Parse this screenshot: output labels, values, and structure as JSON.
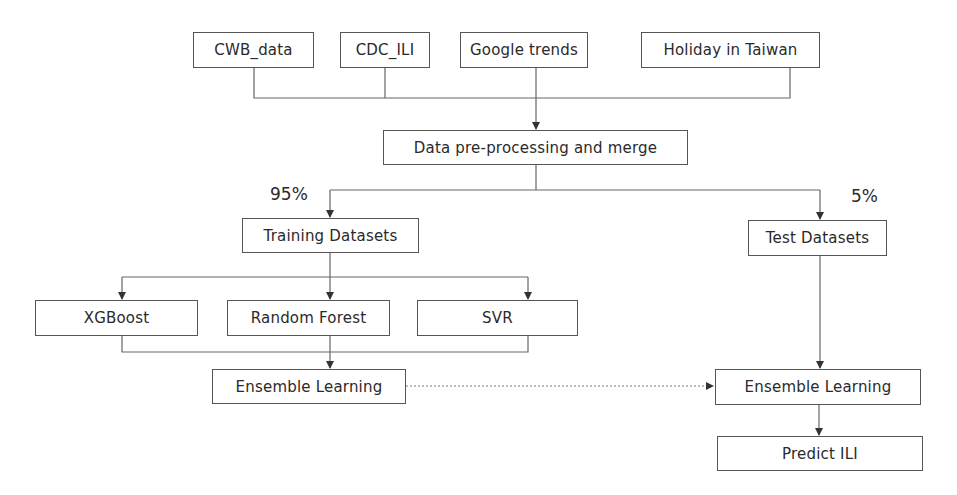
{
  "diagram": {
    "type": "flowchart",
    "sources": [
      {
        "id": "cwb",
        "label": "CWB_data"
      },
      {
        "id": "cdc",
        "label": "CDC_ILI"
      },
      {
        "id": "google",
        "label": "Google trends"
      },
      {
        "id": "holiday",
        "label": "Holiday in Taiwan"
      }
    ],
    "preprocess": {
      "label": "Data pre-processing and merge"
    },
    "split": {
      "train_pct": "95%",
      "test_pct": "5%"
    },
    "training": {
      "label": "Training Datasets"
    },
    "test": {
      "label": "Test Datasets"
    },
    "models": [
      {
        "id": "xgb",
        "label": "XGBoost"
      },
      {
        "id": "rf",
        "label": "Random Forest"
      },
      {
        "id": "svr",
        "label": "SVR"
      }
    ],
    "ensemble_train": {
      "label": "Ensemble Learning"
    },
    "ensemble_test": {
      "label": "Ensemble Learning"
    },
    "predict": {
      "label": "Predict ILI"
    },
    "edges": [
      {
        "from": "CWB_data",
        "to": "Data pre-processing and merge"
      },
      {
        "from": "CDC_ILI",
        "to": "Data pre-processing and merge"
      },
      {
        "from": "Google trends",
        "to": "Data pre-processing and merge"
      },
      {
        "from": "Holiday in Taiwan",
        "to": "Data pre-processing and merge"
      },
      {
        "from": "Data pre-processing and merge",
        "to": "Training Datasets",
        "label": "95%"
      },
      {
        "from": "Data pre-processing and merge",
        "to": "Test Datasets",
        "label": "5%"
      },
      {
        "from": "Training Datasets",
        "to": "XGBoost"
      },
      {
        "from": "Training Datasets",
        "to": "Random Forest"
      },
      {
        "from": "Training Datasets",
        "to": "SVR"
      },
      {
        "from": "XGBoost",
        "to": "Ensemble Learning (train)"
      },
      {
        "from": "Random Forest",
        "to": "Ensemble Learning (train)"
      },
      {
        "from": "SVR",
        "to": "Ensemble Learning (train)"
      },
      {
        "from": "Ensemble Learning (train)",
        "to": "Ensemble Learning (test)",
        "style": "dotted"
      },
      {
        "from": "Test Datasets",
        "to": "Ensemble Learning (test)"
      },
      {
        "from": "Ensemble Learning (test)",
        "to": "Predict ILI"
      }
    ],
    "colors": {
      "line": "#555555",
      "text": "#2a2a2a",
      "background": "#ffffff"
    }
  }
}
